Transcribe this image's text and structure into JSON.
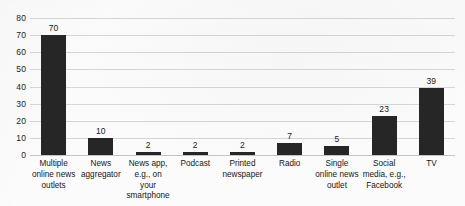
{
  "chart_data": {
    "type": "bar",
    "title": "",
    "xlabel": "",
    "ylabel": "",
    "ylim": [
      0,
      80
    ],
    "ytick_step": 10,
    "yticks": [
      "80",
      "70",
      "60",
      "50",
      "40",
      "30",
      "20",
      "10",
      "0"
    ],
    "grid": true,
    "legend": false,
    "bar_color": "#262626",
    "gridline_color": "#d6d6d6",
    "background_color": "#fbfbfb",
    "categories": [
      "Multiple online news outlets",
      "News aggregator",
      "News app, e.g., on your smartphone",
      "Podcast",
      "Printed newspaper",
      "Radio",
      "Single online news outlet",
      "Social media, e.g., Facebook",
      "TV"
    ],
    "values": [
      70,
      10,
      2,
      2,
      2,
      7,
      5,
      23,
      39
    ],
    "data_labels": [
      "70",
      "10",
      "2",
      "2",
      "2",
      "7",
      "5",
      "23",
      "39"
    ]
  }
}
